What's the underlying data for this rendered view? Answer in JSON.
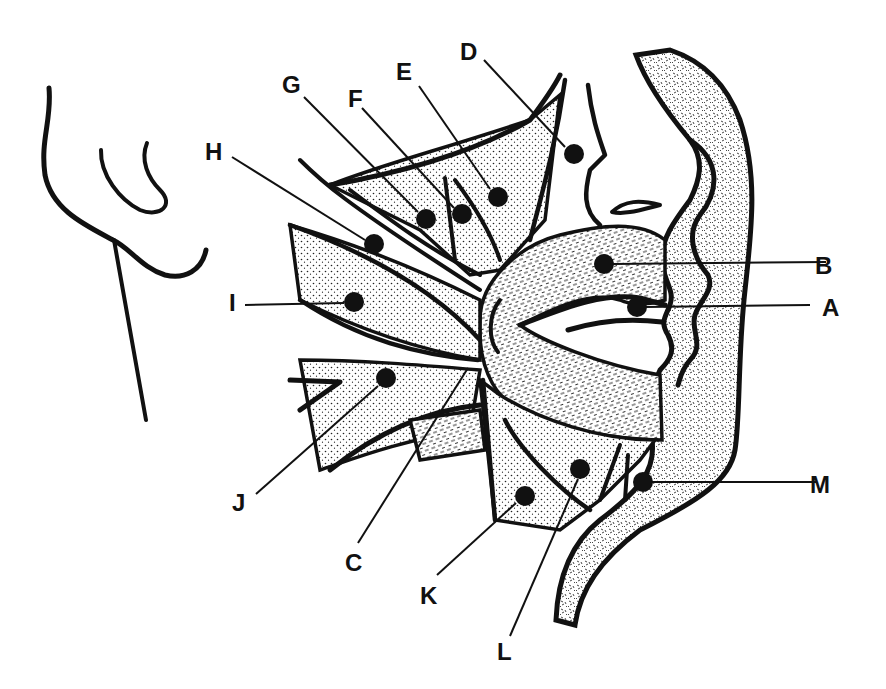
{
  "figure": {
    "background": "#ffffff",
    "ink_color": "#111111"
  },
  "labels": [
    {
      "id": "A",
      "text": "A",
      "text_x": 822,
      "text_y": 316,
      "dot_x": 637,
      "dot_y": 307,
      "line": [
        [
          646,
          307
        ],
        [
          810,
          305
        ]
      ]
    },
    {
      "id": "B",
      "text": "B",
      "text_x": 815,
      "text_y": 274,
      "dot_x": 604,
      "dot_y": 264,
      "line": [
        [
          613,
          264
        ],
        [
          826,
          262
        ]
      ]
    },
    {
      "id": "C",
      "text": "C",
      "text_x": 345,
      "text_y": 571,
      "dot_x": 0,
      "dot_y": 0,
      "line": [
        [
          358,
          543
        ],
        [
          468,
          368
        ]
      ]
    },
    {
      "id": "D",
      "text": "D",
      "text_x": 460,
      "text_y": 60,
      "dot_x": 574,
      "dot_y": 154,
      "line": [
        [
          484,
          60
        ],
        [
          565,
          147
        ]
      ]
    },
    {
      "id": "E",
      "text": "E",
      "text_x": 396,
      "text_y": 80,
      "dot_x": 498,
      "dot_y": 197,
      "line": [
        [
          419,
          86
        ],
        [
          490,
          189
        ]
      ]
    },
    {
      "id": "F",
      "text": "F",
      "text_x": 348,
      "text_y": 107,
      "dot_x": 462,
      "dot_y": 214,
      "line": [
        [
          362,
          108
        ],
        [
          454,
          208
        ]
      ]
    },
    {
      "id": "G",
      "text": "G",
      "text_x": 282,
      "text_y": 93,
      "dot_x": 426,
      "dot_y": 219,
      "line": [
        [
          304,
          97
        ],
        [
          418,
          212
        ]
      ]
    },
    {
      "id": "H",
      "text": "H",
      "text_x": 205,
      "text_y": 160,
      "dot_x": 374,
      "dot_y": 244,
      "line": [
        [
          232,
          157
        ],
        [
          365,
          240
        ]
      ]
    },
    {
      "id": "I",
      "text": "I",
      "text_x": 229,
      "text_y": 311,
      "dot_x": 354,
      "dot_y": 302,
      "line": [
        [
          245,
          305
        ],
        [
          344,
          303
        ]
      ]
    },
    {
      "id": "J",
      "text": "J",
      "text_x": 232,
      "text_y": 511,
      "dot_x": 386,
      "dot_y": 378,
      "line": [
        [
          256,
          494
        ],
        [
          378,
          386
        ]
      ]
    },
    {
      "id": "K",
      "text": "K",
      "text_x": 420,
      "text_y": 604,
      "dot_x": 525,
      "dot_y": 496,
      "line": [
        [
          437,
          575
        ],
        [
          516,
          503
        ]
      ]
    },
    {
      "id": "L",
      "text": "L",
      "text_x": 497,
      "text_y": 660,
      "dot_x": 580,
      "dot_y": 469,
      "line": [
        [
          510,
          636
        ],
        [
          578,
          479
        ]
      ]
    },
    {
      "id": "M",
      "text": "M",
      "text_x": 810,
      "text_y": 493,
      "dot_x": 643,
      "dot_y": 482,
      "line": [
        [
          652,
          482
        ],
        [
          816,
          482
        ]
      ]
    }
  ]
}
